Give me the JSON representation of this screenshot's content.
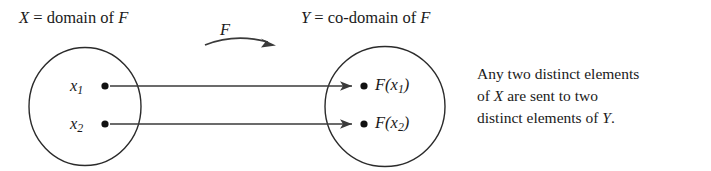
{
  "figure": {
    "background_color": "#ffffff",
    "ink_color": "#1a1a1a",
    "width": 711,
    "height": 171
  },
  "labels": {
    "domain_var": "X",
    "domain_text": " = domain of ",
    "domain_func": "F",
    "codomain_var": "Y",
    "codomain_text": " = co-domain of ",
    "codomain_func": "F",
    "function_arrow_label": "F"
  },
  "domain_set": {
    "name": "X",
    "elements": [
      {
        "base": "x",
        "sub": "1"
      },
      {
        "base": "x",
        "sub": "2"
      }
    ]
  },
  "codomain_set": {
    "name": "Y",
    "elements": [
      {
        "prefix": "F(",
        "base": "x",
        "sub": "1",
        "suffix": ")"
      },
      {
        "prefix": "F(",
        "base": "x",
        "sub": "2",
        "suffix": ")"
      }
    ]
  },
  "mappings": [
    {
      "from": "x1",
      "to": "F(x1)"
    },
    {
      "from": "x2",
      "to": "F(x2)"
    }
  ],
  "caption": {
    "line1": "Any two distinct elements",
    "line2_a": "of ",
    "line2_var": "X",
    "line2_b": " are sent to two",
    "line3_a": "distinct elements of ",
    "line3_var": "Y",
    "line3_b": "."
  }
}
